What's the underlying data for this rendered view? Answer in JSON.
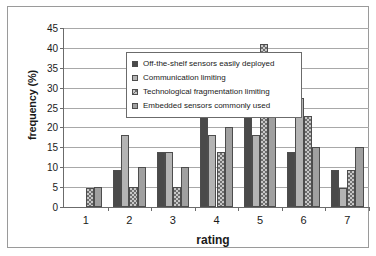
{
  "chart_data": {
    "type": "bar",
    "title": "",
    "xlabel": "rating",
    "ylabel": "frequency (%)",
    "categories": [
      "1",
      "2",
      "3",
      "4",
      "5",
      "6",
      "7"
    ],
    "ylim": [
      0,
      45
    ],
    "ytick_values": [
      0,
      5,
      10,
      15,
      20,
      25,
      30,
      35,
      40,
      45
    ],
    "ytick_labels": [
      "0",
      "5",
      "10",
      "15",
      "20",
      "25",
      "30",
      "35",
      "40",
      "45"
    ],
    "grid": "horizontal",
    "legend_position": "upper-left-inside",
    "series": [
      {
        "name": "Off-the-shelf sensors easily deployed",
        "swatch": "#4a4a4a",
        "pattern": "solid",
        "values": [
          0,
          9.2,
          13.8,
          27.4,
          27.4,
          13.8,
          9.3
        ]
      },
      {
        "name": "Communication limiting",
        "swatch": "#b4b4b4",
        "pattern": "solid",
        "values": [
          0,
          18.2,
          13.8,
          18.2,
          18.2,
          27.4,
          4.8
        ]
      },
      {
        "name": "Technological fragmentation limiting",
        "swatch": "#c8c8c8",
        "pattern": "checker",
        "values": [
          4.8,
          5.0,
          5.0,
          13.8,
          41.0,
          23.0,
          9.3
        ]
      },
      {
        "name": "Embedded sensors commonly used",
        "swatch": "#a0a0a0",
        "pattern": "solid",
        "values": [
          5.0,
          10.0,
          10.0,
          20.0,
          25.2,
          15.1,
          15.1
        ]
      }
    ]
  }
}
